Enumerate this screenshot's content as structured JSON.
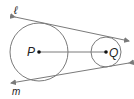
{
  "diagram": {
    "type": "geometry-common-external-tangents",
    "circles": [
      {
        "label": "P",
        "cx": 39,
        "cy": 52,
        "r": 29
      },
      {
        "label": "Q",
        "cx": 106,
        "cy": 52,
        "r": 15
      }
    ],
    "segment": {
      "from": "P",
      "to": "Q"
    },
    "lines": [
      {
        "label": "ℓ",
        "x1": 15,
        "y1": 17,
        "x2": 129,
        "y2": 41
      },
      {
        "label": "m",
        "x1": 11,
        "y1": 83,
        "x2": 129,
        "y2": 63
      }
    ],
    "colors": {
      "stroke": "#7a7a7a",
      "text": "#222222",
      "point": "#111111"
    }
  }
}
